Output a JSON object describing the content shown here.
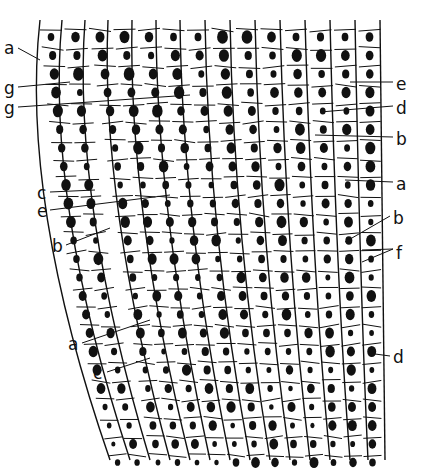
{
  "figure": {
    "labels_left": [
      {
        "id": "a1",
        "text": "a",
        "x": 4,
        "y": 40
      },
      {
        "id": "g1",
        "text": "g",
        "x": 4,
        "y": 80
      },
      {
        "id": "g2",
        "text": "g",
        "x": 4,
        "y": 100
      },
      {
        "id": "c1",
        "text": "c",
        "x": 37,
        "y": 185
      },
      {
        "id": "e1",
        "text": "e",
        "x": 37,
        "y": 203
      },
      {
        "id": "b1",
        "text": "b",
        "x": 52,
        "y": 238
      },
      {
        "id": "a2",
        "text": "a",
        "x": 68,
        "y": 336
      },
      {
        "id": "c2",
        "text": "c",
        "x": 93,
        "y": 365
      }
    ],
    "labels_right": [
      {
        "id": "e2",
        "text": "e",
        "x": 396,
        "y": 76
      },
      {
        "id": "d1",
        "text": "d",
        "x": 396,
        "y": 100
      },
      {
        "id": "b2",
        "text": "b",
        "x": 396,
        "y": 131
      },
      {
        "id": "a3",
        "text": "a",
        "x": 396,
        "y": 176
      },
      {
        "id": "b3",
        "text": "b",
        "x": 393,
        "y": 210
      },
      {
        "id": "f1",
        "text": "f",
        "x": 396,
        "y": 245
      },
      {
        "id": "d2",
        "text": "d",
        "x": 393,
        "y": 349
      }
    ]
  }
}
